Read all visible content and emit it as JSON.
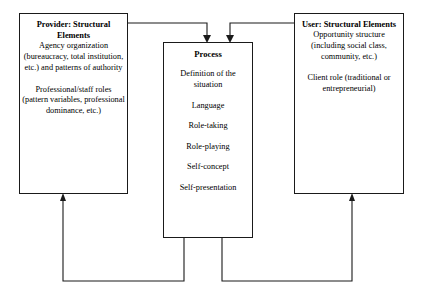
{
  "diagram": {
    "background_color": "#ffffff",
    "line_color": "#1a1a1a",
    "text_color": "#000000"
  },
  "provider": {
    "title": "Provider:  Structural Elements",
    "paragraphs": [
      "Agency organization (bureaucracy, total institution, etc.) and patterns of authority",
      "Professional/staff roles (pattern variables, professional dominance, etc.)"
    ]
  },
  "process": {
    "title": "Process",
    "items": [
      "Definition of the situation",
      "Language",
      "Role-taking",
      "Role-playing",
      "Self-concept",
      "Self-presentation"
    ]
  },
  "user": {
    "title": "User:  Structural Elements",
    "paragraphs": [
      "Opportunity structure (including social class, community, etc.)",
      "Client role (traditional or entrepreneurial)"
    ]
  },
  "connectors": [
    {
      "name": "provider-to-process",
      "from": "provider",
      "to": "process",
      "arrowhead": "down"
    },
    {
      "name": "user-to-process",
      "from": "user",
      "to": "process",
      "arrowhead": "down"
    },
    {
      "name": "process-to-provider",
      "from": "process",
      "to": "provider",
      "arrowhead": "up"
    },
    {
      "name": "process-to-user",
      "from": "process",
      "to": "user",
      "arrowhead": "up"
    }
  ]
}
